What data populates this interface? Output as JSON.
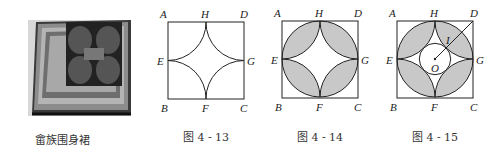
{
  "photo": {
    "caption": "畲族围身裙",
    "description": "photo of She ethnic embroidered apron"
  },
  "figures": [
    {
      "caption": "图 4 - 13",
      "labels": {
        "A": "A",
        "H": "H",
        "D": "D",
        "E": "E",
        "G": "G",
        "B": "B",
        "F": "F",
        "C": "C"
      }
    },
    {
      "caption": "图 4 - 14",
      "labels": {
        "A": "A",
        "H": "H",
        "D": "D",
        "E": "E",
        "G": "G",
        "B": "B",
        "F": "F",
        "C": "C"
      }
    },
    {
      "caption": "图 4 - 15",
      "labels": {
        "A": "A",
        "H": "H",
        "D": "D",
        "E": "E",
        "G": "G",
        "B": "B",
        "F": "F",
        "C": "C",
        "O": "O",
        "I": "I"
      }
    }
  ],
  "colors": {
    "shade": "#c8c8c8",
    "line": "#222222"
  }
}
